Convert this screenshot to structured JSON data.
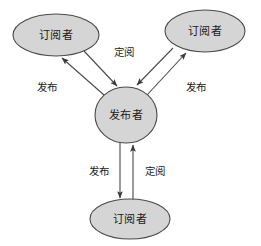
{
  "diagram": {
    "type": "publish-subscribe-topology",
    "background_color": "#ffffff",
    "node_fill_color": "#d5d5d5",
    "node_stroke_color": "#4a4a4a",
    "nodes": [
      {
        "id": "subscriber_top_left",
        "label": "订阅者",
        "shape": "ellipse",
        "cx": 56,
        "cy": 35,
        "rx": 43,
        "ry": 21
      },
      {
        "id": "subscriber_top_right",
        "label": "订阅者",
        "shape": "ellipse",
        "cx": 205,
        "cy": 31,
        "rx": 40,
        "ry": 21
      },
      {
        "id": "publisher_center",
        "label": "发布者",
        "shape": "circle",
        "cx": 126,
        "cy": 115,
        "rx": 31,
        "ry": 28
      },
      {
        "id": "subscriber_bottom",
        "label": "订阅者",
        "shape": "ellipse",
        "cx": 130,
        "cy": 219,
        "rx": 40,
        "ry": 20
      }
    ],
    "edges": [
      {
        "id": "edge-publish-top-left",
        "label": "发布",
        "from": "publisher_center",
        "to": "subscriber_top_left",
        "label_x": 47,
        "label_y": 88
      },
      {
        "id": "edge-subscribe-top-left",
        "label": "定阅",
        "from": "subscriber_top_left",
        "to": "publisher_center",
        "label_x": 124,
        "label_y": 53
      },
      {
        "id": "edge-publish-top-right",
        "label": "发布",
        "from": "publisher_center",
        "to": "subscriber_top_right",
        "label_x": 196,
        "label_y": 88
      },
      {
        "id": "edge-subscribe-top-right",
        "label": "定阅",
        "from": "subscriber_top_right",
        "to": "publisher_center",
        "label_x": 124,
        "label_y": 53
      },
      {
        "id": "edge-publish-bottom",
        "label": "发布",
        "from": "publisher_center",
        "to": "subscriber_bottom",
        "label_x": 99,
        "label_y": 172
      },
      {
        "id": "edge-subscribe-bottom",
        "label": "定阅",
        "from": "subscriber_bottom",
        "to": "publisher_center",
        "label_x": 155,
        "label_y": 172
      }
    ]
  }
}
